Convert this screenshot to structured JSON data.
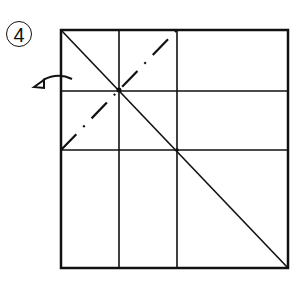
{
  "diagram": {
    "type": "origami-fold-step",
    "step_number": "4",
    "colors": {
      "line": "#111111",
      "background": "#ffffff"
    },
    "square": {
      "left": 61,
      "top": 30,
      "right": 288,
      "bottom": 268
    },
    "crease_lines": {
      "vertical": [
        119,
        177
      ],
      "horizontal": [
        91,
        150
      ]
    },
    "valley_diagonal": {
      "from": "top-left",
      "to": "bottom-right"
    },
    "mountain_fold_line": {
      "style": "dash-dot",
      "from": "bottom-left corner",
      "to": "top-right of left third"
    },
    "fold_arrow": {
      "direction": "behind",
      "position": "left edge"
    }
  }
}
